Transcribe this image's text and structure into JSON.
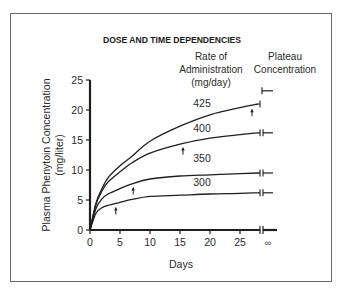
{
  "chart_data": {
    "type": "line",
    "title": "DOSE AND TIME DEPENDENCIES",
    "xlabel": "Days",
    "ylabel": "Plasma Phenytoin Concentration",
    "ylabel_units": "(mg/liter)",
    "xlim": [
      0,
      28
    ],
    "ylim": [
      0,
      25
    ],
    "x_ticks": [
      "0",
      "5",
      "10",
      "15",
      "20",
      "25",
      "∞"
    ],
    "y_ticks": [
      "0",
      "5",
      "10",
      "15",
      "20",
      "25"
    ],
    "grid": false,
    "legend_headers": {
      "rate": [
        "Rate of",
        "Administration",
        "(mg/day)"
      ],
      "plateau": [
        "Plateau",
        "Concentration"
      ]
    },
    "x": [
      0,
      1,
      2,
      3,
      5,
      7,
      10,
      15,
      20,
      25,
      28
    ],
    "series": [
      {
        "name": "425",
        "unit": "mg/day",
        "values": [
          0,
          4.5,
          6.9,
          8.7,
          10.7,
          12.3,
          14.8,
          17.3,
          19.2,
          20.4,
          21.0
        ],
        "plateau": 23.2,
        "arrow_day": 27
      },
      {
        "name": "400",
        "unit": "mg/day",
        "values": [
          0,
          4.3,
          6.5,
          8.0,
          9.7,
          11.2,
          12.8,
          14.3,
          15.3,
          15.9,
          16.2
        ],
        "plateau": 16.2,
        "arrow_day": 15.5
      },
      {
        "name": "350",
        "unit": "mg/day",
        "values": [
          0,
          3.6,
          5.2,
          6.0,
          6.9,
          7.7,
          8.5,
          9.0,
          9.2,
          9.4,
          9.5
        ],
        "plateau": 9.5,
        "arrow_day": 7.2
      },
      {
        "name": "300",
        "unit": "mg/day",
        "values": [
          0,
          2.8,
          3.7,
          4.1,
          4.6,
          5.1,
          5.6,
          5.8,
          6.0,
          6.1,
          6.2
        ],
        "plateau": 6.2,
        "arrow_day": 4.3
      }
    ],
    "annotations": [
      "Arrows mark time to reach 90% of plateau concentration",
      "Axis break before ∞ (plateau)"
    ]
  },
  "text": {
    "title": "DOSE AND TIME DEPENDENCIES",
    "rate_header_1": "Rate of",
    "rate_header_2": "Administration",
    "rate_header_3": "(mg/day)",
    "plateau_header_1": "Plateau",
    "plateau_header_2": "Concentration",
    "ylabel_1": "Plasma Phenytoin Concentration",
    "ylabel_2": "(mg/liter)",
    "xlabel": "Days",
    "infinity": "∞"
  }
}
